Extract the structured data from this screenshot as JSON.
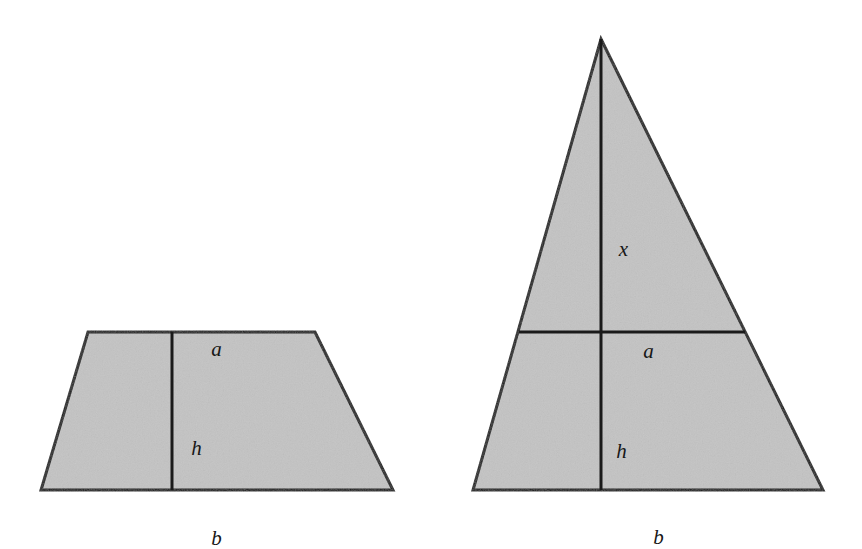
{
  "figure": {
    "background_color": "#ffffff",
    "fill_color": "#c3c3c3",
    "stroke_color": "#1a1a1a",
    "label_color": "#171717",
    "stroke_width": 3,
    "canvas": {
      "width": 862,
      "height": 535
    }
  },
  "shapes": {
    "trapezoid": {
      "name": "trapezoid",
      "points": "88,332 315,332 393,490 41,490",
      "height_line": {
        "x1": 172,
        "y1": 332,
        "x2": 172,
        "y2": 490
      },
      "labels": {
        "top": {
          "text": "a",
          "x": 206,
          "y": 318
        },
        "height": {
          "text": "h",
          "x": 186,
          "y": 417
        },
        "base": {
          "text": "b",
          "x": 206,
          "y": 507
        }
      }
    },
    "triangle": {
      "name": "triangle",
      "points": "601,39 823,490 473,490",
      "midline": {
        "x1": 519,
        "y1": 332,
        "x2": 745,
        "y2": 332
      },
      "altitude_line": {
        "x1": 601,
        "y1": 39,
        "x2": 601,
        "y2": 490
      },
      "labels": {
        "upper_height": {
          "text": "x",
          "x": 613,
          "y": 218
        },
        "midline": {
          "text": "a",
          "x": 638,
          "y": 320
        },
        "lower_height": {
          "text": "h",
          "x": 611,
          "y": 420
        },
        "base": {
          "text": "b",
          "x": 648,
          "y": 506
        }
      }
    }
  }
}
